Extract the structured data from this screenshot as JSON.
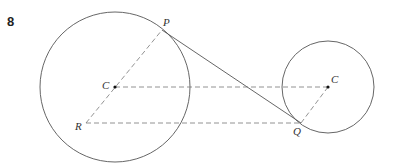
{
  "question": {
    "number": "8"
  },
  "diagram": {
    "labels": {
      "P": "P",
      "C1": "C",
      "R": "R",
      "C2": "C",
      "Q": "Q"
    },
    "colors": {
      "stroke": "#555555",
      "dash": "#777777",
      "text": "#333333"
    },
    "elements": [
      "large circle centred at C",
      "small circle centred at C",
      "tangent segment PQ",
      "dashed segment RP through C",
      "dashed segment from C to C",
      "dashed segment from R to Q",
      "dashed segment from Q to C"
    ]
  }
}
